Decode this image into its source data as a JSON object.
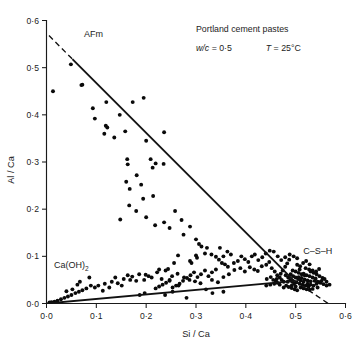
{
  "chart_data": {
    "type": "scatter",
    "title": "",
    "xlabel": "Si / Ca",
    "ylabel": "Al / Ca",
    "xlim": [
      0.0,
      0.6
    ],
    "ylim": [
      0.0,
      0.6
    ],
    "xticks": [
      0.0,
      0.1,
      0.2,
      0.3,
      0.4,
      0.5,
      0.6
    ],
    "yticks": [
      0.0,
      0.1,
      0.2,
      0.3,
      0.4,
      0.5,
      0.6
    ],
    "xticklabels": [
      "0·0",
      "0·1",
      "0·2",
      "0·3",
      "0·4",
      "0·5",
      "0·6"
    ],
    "yticklabels": [
      "0·0",
      "0·1",
      "0·2",
      "0·3",
      "0·4",
      "0·5",
      "0·6"
    ],
    "grid": false,
    "legend": false,
    "marker": "filled-circle",
    "annotations": [
      {
        "name": "afm-label",
        "text": "AFm",
        "x": 0.075,
        "y": 0.565
      },
      {
        "name": "caoh2-label",
        "text": "Ca(OH)",
        "subscript": "2",
        "x": 0.015,
        "y": 0.075
      },
      {
        "name": "csh-label",
        "text": "C–S–H",
        "x": 0.515,
        "y": 0.105
      },
      {
        "name": "sample-title",
        "text": "Portland cement pastes",
        "x": 0.3,
        "y": 0.575
      },
      {
        "name": "wc-ratio",
        "italic_part": "w/c",
        "text": " = 0·5",
        "x": 0.3,
        "y": 0.535
      },
      {
        "name": "temperature",
        "italic_part": "T",
        "text": " = 25°C",
        "x": 0.44,
        "y": 0.535
      }
    ],
    "trendlines": [
      {
        "name": "afm-tieline",
        "style": "solid",
        "x": [
          0.052,
          0.497
        ],
        "y": [
          0.518,
          0.048
        ]
      },
      {
        "name": "afm-tieline-extension-upper",
        "style": "dashed",
        "x": [
          0.005,
          0.055
        ],
        "y": [
          0.568,
          0.515
        ]
      },
      {
        "name": "afm-tieline-extension-lower",
        "style": "dashed",
        "x": [
          0.495,
          0.568
        ],
        "y": [
          0.05,
          -0.002
        ]
      },
      {
        "name": "caoh2-tieline",
        "style": "solid",
        "x": [
          0.0,
          0.5
        ],
        "y": [
          0.0,
          0.048
        ]
      }
    ],
    "series": [
      {
        "name": "microanalyses",
        "points": [
          [
            0.013,
            0.45
          ],
          [
            0.049,
            0.507
          ],
          [
            0.07,
            0.463
          ],
          [
            0.072,
            0.464
          ],
          [
            0.093,
            0.414
          ],
          [
            0.097,
            0.392
          ],
          [
            0.12,
            0.427
          ],
          [
            0.119,
            0.377
          ],
          [
            0.122,
            0.373
          ],
          [
            0.116,
            0.36
          ],
          [
            0.147,
            0.4
          ],
          [
            0.136,
            0.352
          ],
          [
            0.158,
            0.365
          ],
          [
            0.173,
            0.427
          ],
          [
            0.195,
            0.436
          ],
          [
            0.162,
            0.306
          ],
          [
            0.163,
            0.295
          ],
          [
            0.16,
            0.258
          ],
          [
            0.167,
            0.243
          ],
          [
            0.2,
            0.345
          ],
          [
            0.236,
            0.363
          ],
          [
            0.219,
            0.297
          ],
          [
            0.235,
            0.296
          ],
          [
            0.209,
            0.306
          ],
          [
            0.213,
            0.288
          ],
          [
            0.181,
            0.272
          ],
          [
            0.19,
            0.252
          ],
          [
            0.194,
            0.222
          ],
          [
            0.214,
            0.228
          ],
          [
            0.166,
            0.208
          ],
          [
            0.148,
            0.178
          ],
          [
            0.18,
            0.196
          ],
          [
            0.2,
            0.183
          ],
          [
            0.218,
            0.166
          ],
          [
            0.236,
            0.172
          ],
          [
            0.247,
            0.16
          ],
          [
            0.258,
            0.196
          ],
          [
            0.271,
            0.177
          ],
          [
            0.288,
            0.163
          ],
          [
            0.275,
            0.146
          ],
          [
            0.3,
            0.136
          ],
          [
            0.306,
            0.126
          ],
          [
            0.311,
            0.121
          ],
          [
            0.322,
            0.118
          ],
          [
            0.318,
            0.106
          ],
          [
            0.331,
            0.104
          ],
          [
            0.34,
            0.099
          ],
          [
            0.346,
            0.093
          ],
          [
            0.352,
            0.086
          ],
          [
            0.358,
            0.083
          ],
          [
            0.364,
            0.078
          ],
          [
            0.3,
            0.102
          ],
          [
            0.302,
            0.097
          ],
          [
            0.288,
            0.09
          ],
          [
            0.291,
            0.086
          ],
          [
            0.264,
            0.102
          ],
          [
            0.256,
            0.086
          ],
          [
            0.244,
            0.073
          ],
          [
            0.222,
            0.066
          ],
          [
            0.205,
            0.058
          ],
          [
            0.196,
            0.05
          ],
          [
            0.18,
            0.048
          ],
          [
            0.168,
            0.05
          ],
          [
            0.155,
            0.052
          ],
          [
            0.143,
            0.043
          ],
          [
            0.131,
            0.046
          ],
          [
            0.117,
            0.042
          ],
          [
            0.104,
            0.038
          ],
          [
            0.097,
            0.034
          ],
          [
            0.089,
            0.038
          ],
          [
            0.08,
            0.032
          ],
          [
            0.072,
            0.028
          ],
          [
            0.065,
            0.025
          ],
          [
            0.058,
            0.022
          ],
          [
            0.05,
            0.018
          ],
          [
            0.043,
            0.015
          ],
          [
            0.036,
            0.012
          ],
          [
            0.029,
            0.009
          ],
          [
            0.022,
            0.006
          ],
          [
            0.016,
            0.004
          ],
          [
            0.01,
            0.003
          ],
          [
            0.006,
            0.002
          ],
          [
            0.04,
            0.026
          ],
          [
            0.052,
            0.03
          ],
          [
            0.062,
            0.04
          ],
          [
            0.067,
            0.046
          ],
          [
            0.086,
            0.055
          ],
          [
            0.113,
            0.027
          ],
          [
            0.126,
            0.034
          ],
          [
            0.138,
            0.055
          ],
          [
            0.151,
            0.038
          ],
          [
            0.163,
            0.06
          ],
          [
            0.172,
            0.057
          ],
          [
            0.186,
            0.062
          ],
          [
            0.199,
            0.061
          ],
          [
            0.211,
            0.055
          ],
          [
            0.226,
            0.072
          ],
          [
            0.239,
            0.07
          ],
          [
            0.252,
            0.058
          ],
          [
            0.263,
            0.063
          ],
          [
            0.276,
            0.055
          ],
          [
            0.287,
            0.05
          ],
          [
            0.298,
            0.047
          ],
          [
            0.309,
            0.043
          ],
          [
            0.32,
            0.03
          ],
          [
            0.332,
            0.05
          ],
          [
            0.344,
            0.045
          ],
          [
            0.355,
            0.056
          ],
          [
            0.366,
            0.062
          ],
          [
            0.377,
            0.071
          ],
          [
            0.389,
            0.075
          ],
          [
            0.398,
            0.068
          ],
          [
            0.408,
            0.077
          ],
          [
            0.417,
            0.072
          ],
          [
            0.424,
            0.069
          ],
          [
            0.432,
            0.079
          ],
          [
            0.441,
            0.082
          ],
          [
            0.447,
            0.088
          ],
          [
            0.452,
            0.075
          ],
          [
            0.458,
            0.068
          ],
          [
            0.463,
            0.06
          ],
          [
            0.468,
            0.055
          ],
          [
            0.472,
            0.05
          ],
          [
            0.476,
            0.046
          ],
          [
            0.463,
            0.044
          ],
          [
            0.457,
            0.042
          ],
          [
            0.449,
            0.04
          ],
          [
            0.441,
            0.038
          ],
          [
            0.455,
            0.05
          ],
          [
            0.462,
            0.052
          ],
          [
            0.47,
            0.063
          ],
          [
            0.474,
            0.07
          ],
          [
            0.479,
            0.078
          ],
          [
            0.483,
            0.085
          ],
          [
            0.487,
            0.093
          ],
          [
            0.48,
            0.06
          ],
          [
            0.485,
            0.055
          ],
          [
            0.489,
            0.05
          ],
          [
            0.493,
            0.046
          ],
          [
            0.497,
            0.042
          ],
          [
            0.481,
            0.038
          ],
          [
            0.486,
            0.035
          ],
          [
            0.492,
            0.033
          ],
          [
            0.498,
            0.03
          ],
          [
            0.503,
            0.028
          ],
          [
            0.49,
            0.062
          ],
          [
            0.495,
            0.058
          ],
          [
            0.5,
            0.055
          ],
          [
            0.505,
            0.052
          ],
          [
            0.51,
            0.049
          ],
          [
            0.494,
            0.07
          ],
          [
            0.5,
            0.068
          ],
          [
            0.506,
            0.065
          ],
          [
            0.512,
            0.062
          ],
          [
            0.518,
            0.06
          ],
          [
            0.502,
            0.045
          ],
          [
            0.508,
            0.042
          ],
          [
            0.514,
            0.04
          ],
          [
            0.52,
            0.038
          ],
          [
            0.526,
            0.036
          ],
          [
            0.506,
            0.056
          ],
          [
            0.512,
            0.054
          ],
          [
            0.518,
            0.051
          ],
          [
            0.524,
            0.049
          ],
          [
            0.53,
            0.047
          ],
          [
            0.516,
            0.063
          ],
          [
            0.522,
            0.06
          ],
          [
            0.528,
            0.058
          ],
          [
            0.534,
            0.055
          ],
          [
            0.54,
            0.053
          ],
          [
            0.51,
            0.034
          ],
          [
            0.516,
            0.032
          ],
          [
            0.522,
            0.03
          ],
          [
            0.528,
            0.029
          ],
          [
            0.534,
            0.031
          ],
          [
            0.524,
            0.042
          ],
          [
            0.53,
            0.04
          ],
          [
            0.536,
            0.038
          ],
          [
            0.542,
            0.042
          ],
          [
            0.548,
            0.045
          ],
          [
            0.53,
            0.068
          ],
          [
            0.536,
            0.065
          ],
          [
            0.542,
            0.062
          ],
          [
            0.548,
            0.058
          ],
          [
            0.554,
            0.054
          ],
          [
            0.538,
            0.048
          ],
          [
            0.544,
            0.046
          ],
          [
            0.55,
            0.044
          ],
          [
            0.556,
            0.041
          ],
          [
            0.562,
            0.038
          ],
          [
            0.52,
            0.075
          ],
          [
            0.527,
            0.072
          ],
          [
            0.534,
            0.07
          ],
          [
            0.541,
            0.068
          ],
          [
            0.547,
            0.073
          ],
          [
            0.503,
            0.082
          ],
          [
            0.509,
            0.079
          ],
          [
            0.515,
            0.086
          ],
          [
            0.521,
            0.09
          ],
          [
            0.528,
            0.083
          ],
          [
            0.496,
            0.1
          ],
          [
            0.503,
            0.096
          ],
          [
            0.488,
            0.104
          ],
          [
            0.479,
            0.098
          ],
          [
            0.471,
            0.092
          ],
          [
            0.464,
            0.1
          ],
          [
            0.456,
            0.11
          ],
          [
            0.448,
            0.112
          ],
          [
            0.44,
            0.106
          ],
          [
            0.433,
            0.098
          ],
          [
            0.425,
            0.092
          ],
          [
            0.418,
            0.104
          ],
          [
            0.412,
            0.1
          ],
          [
            0.405,
            0.088
          ],
          [
            0.398,
            0.094
          ],
          [
            0.391,
            0.1
          ],
          [
            0.384,
            0.09
          ],
          [
            0.376,
            0.086
          ],
          [
            0.37,
            0.104
          ],
          [
            0.363,
            0.11
          ],
          [
            0.355,
            0.1
          ],
          [
            0.348,
            0.118
          ],
          [
            0.34,
            0.072
          ],
          [
            0.332,
            0.066
          ],
          [
            0.325,
            0.058
          ],
          [
            0.318,
            0.07
          ],
          [
            0.31,
            0.062
          ],
          [
            0.303,
            0.056
          ],
          [
            0.296,
            0.066
          ],
          [
            0.289,
            0.06
          ],
          [
            0.282,
            0.054
          ],
          [
            0.274,
            0.048
          ],
          [
            0.267,
            0.042
          ],
          [
            0.26,
            0.038
          ],
          [
            0.253,
            0.034
          ],
          [
            0.247,
            0.05
          ],
          [
            0.24,
            0.044
          ],
          [
            0.233,
            0.04
          ],
          [
            0.226,
            0.036
          ],
          [
            0.219,
            0.032
          ],
          [
            0.333,
            0.022
          ],
          [
            0.355,
            0.025
          ],
          [
            0.253,
            0.025
          ],
          [
            0.238,
            0.018
          ],
          [
            0.281,
            0.012
          ],
          [
            0.197,
            0.022
          ],
          [
            0.187,
            0.018
          ],
          [
            0.247,
            0.048
          ],
          [
            0.231,
            0.052
          ],
          [
            0.265,
            0.038
          ],
          [
            0.442,
            0.052
          ],
          [
            0.45,
            0.056
          ],
          [
            0.46,
            0.048
          ],
          [
            0.468,
            0.04
          ],
          [
            0.476,
            0.034
          ],
          [
            0.484,
            0.046
          ],
          [
            0.492,
            0.038
          ],
          [
            0.5,
            0.036
          ],
          [
            0.508,
            0.072
          ],
          [
            0.516,
            0.046
          ],
          [
            0.544,
            0.034
          ],
          [
            0.552,
            0.048
          ],
          [
            0.558,
            0.052
          ],
          [
            0.562,
            0.046
          ],
          [
            0.568,
            0.04
          ]
        ]
      }
    ]
  }
}
